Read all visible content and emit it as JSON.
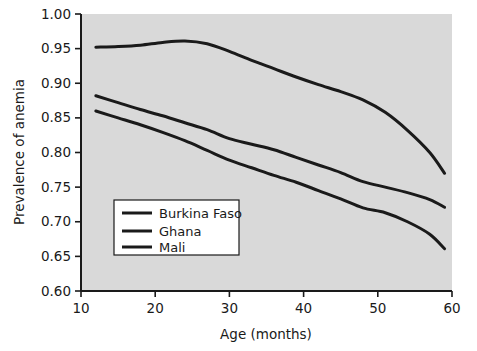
{
  "chart_data": {
    "type": "line",
    "title": "",
    "xlabel": "Age (months)",
    "ylabel": "Prevalence of anemia",
    "xlim": [
      10,
      60
    ],
    "ylim": [
      0.6,
      1.0
    ],
    "xticks": [
      10,
      20,
      30,
      40,
      50,
      60
    ],
    "xtick_labels": [
      "10",
      "20",
      "30",
      "40",
      "50",
      "60"
    ],
    "yticks": [
      0.6,
      0.65,
      0.7,
      0.75,
      0.8,
      0.85,
      0.9,
      0.95,
      1.0
    ],
    "ytick_labels": [
      "0.60",
      "0.65",
      "0.70",
      "0.75",
      "0.80",
      "0.85",
      "0.90",
      "0.95",
      "1.00"
    ],
    "grid": false,
    "legend_position": "lower left (inside panel)",
    "panel_background": "#d9d9d9",
    "figure_background": "#ffffff",
    "line_color": "#1a1a1a",
    "series": [
      {
        "name": "Burkina Faso",
        "color": "#1a1a1a",
        "x": [
          12,
          15,
          18,
          21,
          24,
          27,
          30,
          33,
          36,
          39,
          42,
          45,
          48,
          51,
          54,
          57,
          59
        ],
        "values": [
          0.952,
          0.953,
          0.955,
          0.959,
          0.961,
          0.957,
          0.946,
          0.933,
          0.921,
          0.909,
          0.898,
          0.888,
          0.876,
          0.858,
          0.832,
          0.8,
          0.77
        ]
      },
      {
        "name": "Ghana",
        "color": "#1a1a1a",
        "x": [
          12,
          15,
          18,
          21,
          24,
          27,
          30,
          33,
          36,
          39,
          42,
          45,
          48,
          51,
          54,
          57,
          59
        ],
        "values": [
          0.882,
          0.872,
          0.862,
          0.853,
          0.843,
          0.833,
          0.82,
          0.812,
          0.804,
          0.793,
          0.782,
          0.771,
          0.758,
          0.75,
          0.742,
          0.732,
          0.721
        ]
      },
      {
        "name": "Mali",
        "color": "#1a1a1a",
        "x": [
          12,
          15,
          18,
          21,
          24,
          27,
          30,
          33,
          36,
          39,
          42,
          45,
          48,
          51,
          54,
          57,
          59
        ],
        "values": [
          0.86,
          0.85,
          0.84,
          0.829,
          0.817,
          0.803,
          0.789,
          0.778,
          0.767,
          0.757,
          0.745,
          0.733,
          0.72,
          0.713,
          0.7,
          0.682,
          0.661
        ]
      }
    ]
  },
  "legend": {
    "entries": [
      {
        "label": "Burkina Faso"
      },
      {
        "label": "Ghana"
      },
      {
        "label": "Mali"
      }
    ]
  }
}
